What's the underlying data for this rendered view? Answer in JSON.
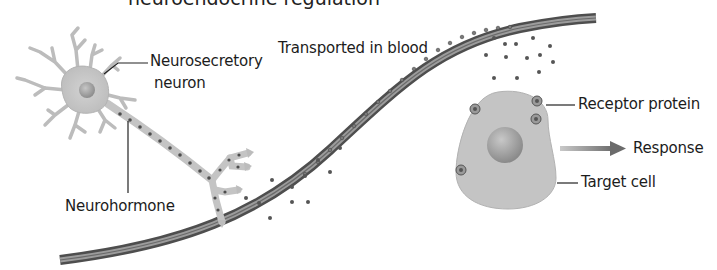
{
  "figure": {
    "title_partial": "neuroendocrine regulation",
    "labels": {
      "neurosecretory_line1": "Neurosecretory",
      "neurosecretory_line2": "neuron",
      "neurohormone": "Neurohormone",
      "transported": "Transported in blood",
      "receptor": "Receptor protein",
      "response": "Response",
      "target_cell": "Target cell"
    },
    "colors": {
      "neuron_fill": "#c9c9c9",
      "neuron_stroke": "#a8a8a8",
      "vessel_dark": "#5a5a5a",
      "vessel_light": "#9a9a9a",
      "hormone_dot": "#555555",
      "cell_fill": "#c4c4c4",
      "nucleus_fill": "#a9a9a9",
      "arrow": "#6b6b6b",
      "leader_line": "#222222"
    }
  }
}
